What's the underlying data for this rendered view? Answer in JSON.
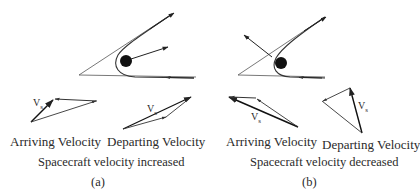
{
  "figure": {
    "panels": [
      {
        "id": "(a)",
        "caption": "Spacecraft velocity increased",
        "arriving_label": "Arriving Velocity",
        "departing_label": "Departing Velocity",
        "vs_label_main": "V",
        "vs_label_sub": "s",
        "planet_motion": "away-from-trajectory-apex"
      },
      {
        "id": "(b)",
        "caption": "Spacecraft  velocity decreased",
        "arriving_label": "Arriving Velocity",
        "departing_label": "Departing Velocity",
        "vs_label_main": "V",
        "vs_label_sub": "s",
        "planet_motion": "toward-upper-left"
      }
    ],
    "colors": {
      "line": "#333333",
      "planet": "#111111",
      "background": "#ffffff"
    }
  }
}
